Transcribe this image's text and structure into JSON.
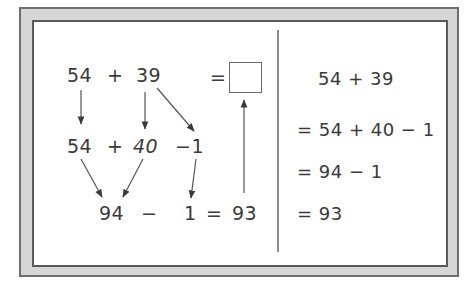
{
  "diagram": {
    "left_panel": {
      "row1": {
        "a": "54",
        "op": "+",
        "b": "39",
        "eq": "="
      },
      "answer_box": "",
      "row2": {
        "a": "54",
        "op": "+",
        "b": "40",
        "c": "−1"
      },
      "row3": {
        "a": "94",
        "op": "−",
        "b": "1",
        "eq": "=",
        "result": "93"
      }
    },
    "right_panel": {
      "lines": [
        "54 + 39",
        "= 54 + 40 − 1",
        "= 94 − 1",
        "= 93"
      ]
    },
    "colors": {
      "text": "#3a3a3a",
      "arrow": "#4a4a4a",
      "frame_fill": "#d6d6d6",
      "frame_border": "#6e6e6e"
    }
  }
}
